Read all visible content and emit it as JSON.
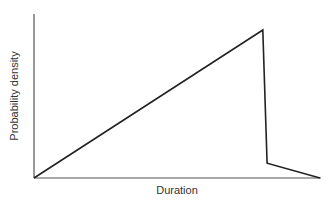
{
  "chart_data": {
    "type": "line",
    "title": "",
    "xlabel": "Duration",
    "ylabel": "Probability density",
    "grid": false,
    "legend": null,
    "x_ticks": [],
    "y_ticks": [],
    "x": [
      0,
      0.8,
      0.815,
      1.0
    ],
    "series": [
      {
        "name": "Probability density",
        "values": [
          0,
          1.0,
          0.1,
          0
        ]
      }
    ],
    "xlim": [
      0,
      1
    ],
    "ylim": [
      0,
      1.1
    ]
  },
  "axes": {
    "x_label": "Duration",
    "y_label": "Probability density"
  },
  "colors": {
    "line": "#222222",
    "axis": "#555555",
    "text": "#333333",
    "background": "#ffffff"
  }
}
